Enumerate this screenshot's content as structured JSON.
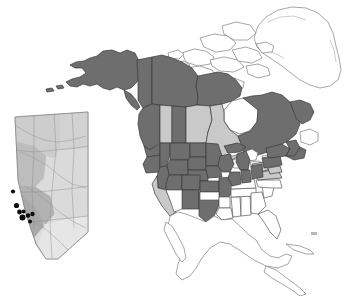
{
  "figure": {
    "title": "",
    "caption": "",
    "background_color": "#ffffff",
    "width": 357,
    "height": 296
  },
  "legend_colors": {
    "shaded_dark": "#6e6e6e",
    "shaded_light": "#c9c9c9",
    "unshaded": "#ffffff",
    "outline": "#5a5a5a",
    "site_dot": "#0d0d0d"
  },
  "main_map": {
    "name": "north-america-distribution-map",
    "region": "North America",
    "shading_classes": [
      "dark",
      "light",
      "white"
    ],
    "regions": [
      {
        "id": "alaska",
        "label": "Alaska",
        "shade": "dark"
      },
      {
        "id": "yukon",
        "label": "Yukon",
        "shade": "dark"
      },
      {
        "id": "northwest-terr",
        "label": "Northwest Territories",
        "shade": "dark"
      },
      {
        "id": "nunavut-mainland",
        "label": "Nunavut",
        "shade": "dark"
      },
      {
        "id": "arctic-islands",
        "label": "Arctic Archipelago",
        "shade": "white"
      },
      {
        "id": "greenland",
        "label": "Greenland",
        "shade": "white"
      },
      {
        "id": "british-columbia",
        "label": "British Columbia",
        "shade": "dark"
      },
      {
        "id": "alberta",
        "label": "Alberta",
        "shade": "light"
      },
      {
        "id": "saskatchewan",
        "label": "Saskatchewan",
        "shade": "dark"
      },
      {
        "id": "manitoba",
        "label": "Manitoba",
        "shade": "light"
      },
      {
        "id": "ontario",
        "label": "Ontario",
        "shade": "light"
      },
      {
        "id": "quebec",
        "label": "Quebec",
        "shade": "dark"
      },
      {
        "id": "labrador",
        "label": "Labrador",
        "shade": "dark"
      },
      {
        "id": "newfoundland",
        "label": "Newfoundland",
        "shade": "white"
      },
      {
        "id": "maritimes",
        "label": "Maritime Provinces",
        "shade": "dark"
      },
      {
        "id": "washington",
        "label": "Washington",
        "shade": "dark"
      },
      {
        "id": "oregon",
        "label": "Oregon",
        "shade": "dark"
      },
      {
        "id": "idaho",
        "label": "Idaho",
        "shade": "dark"
      },
      {
        "id": "montana",
        "label": "Montana",
        "shade": "dark"
      },
      {
        "id": "wyoming",
        "label": "Wyoming",
        "shade": "dark"
      },
      {
        "id": "north-dakota",
        "label": "North Dakota",
        "shade": "dark"
      },
      {
        "id": "south-dakota",
        "label": "South Dakota",
        "shade": "dark"
      },
      {
        "id": "nebraska",
        "label": "Nebraska",
        "shade": "dark"
      },
      {
        "id": "minnesota",
        "label": "Minnesota",
        "shade": "dark"
      },
      {
        "id": "iowa",
        "label": "Iowa",
        "shade": "dark"
      },
      {
        "id": "wisconsin",
        "label": "Wisconsin",
        "shade": "dark"
      },
      {
        "id": "michigan",
        "label": "Michigan",
        "shade": "dark"
      },
      {
        "id": "illinois",
        "label": "Illinois",
        "shade": "dark"
      },
      {
        "id": "indiana",
        "label": "Indiana",
        "shade": "dark"
      },
      {
        "id": "ohio",
        "label": "Ohio",
        "shade": "dark"
      },
      {
        "id": "pennsylvania",
        "label": "Pennsylvania",
        "shade": "dark"
      },
      {
        "id": "new-york",
        "label": "New York",
        "shade": "dark"
      },
      {
        "id": "new-england",
        "label": "New England",
        "shade": "dark"
      },
      {
        "id": "nevada",
        "label": "Nevada",
        "shade": "dark"
      },
      {
        "id": "utah",
        "label": "Utah",
        "shade": "dark"
      },
      {
        "id": "colorado",
        "label": "Colorado",
        "shade": "dark"
      },
      {
        "id": "kansas",
        "label": "Kansas",
        "shade": "dark"
      },
      {
        "id": "missouri",
        "label": "Missouri",
        "shade": "dark"
      },
      {
        "id": "new-mexico",
        "label": "New Mexico",
        "shade": "dark"
      },
      {
        "id": "texas",
        "label": "Texas",
        "shade": "dark"
      },
      {
        "id": "california",
        "label": "California",
        "shade": "light"
      },
      {
        "id": "arizona",
        "label": "Arizona",
        "shade": "white"
      },
      {
        "id": "oklahoma",
        "label": "Oklahoma",
        "shade": "white"
      },
      {
        "id": "arkansas",
        "label": "Arkansas",
        "shade": "white"
      },
      {
        "id": "kentucky",
        "label": "Kentucky",
        "shade": "white"
      },
      {
        "id": "west-virginia",
        "label": "West Virginia",
        "shade": "light"
      },
      {
        "id": "virginia",
        "label": "Virginia",
        "shade": "light"
      },
      {
        "id": "maryland",
        "label": "Maryland",
        "shade": "light"
      },
      {
        "id": "tennessee",
        "label": "Tennessee",
        "shade": "white"
      },
      {
        "id": "north-carolina",
        "label": "North Carolina",
        "shade": "white"
      },
      {
        "id": "south-carolina",
        "label": "South Carolina",
        "shade": "white"
      },
      {
        "id": "georgia",
        "label": "Georgia",
        "shade": "white"
      },
      {
        "id": "florida",
        "label": "Florida",
        "shade": "white"
      },
      {
        "id": "alabama",
        "label": "Alabama",
        "shade": "white"
      },
      {
        "id": "mississippi",
        "label": "Mississippi",
        "shade": "white"
      },
      {
        "id": "louisiana",
        "label": "Louisiana",
        "shade": "white"
      },
      {
        "id": "mexico",
        "label": "Mexico",
        "shade": "white"
      },
      {
        "id": "central-america",
        "label": "Central America",
        "shade": "white"
      },
      {
        "id": "cuba",
        "label": "Cuba",
        "shade": "white"
      },
      {
        "id": "great-lakes",
        "label": "Great Lakes",
        "shade": "white"
      },
      {
        "id": "hudson-bay",
        "label": "Hudson Bay",
        "shade": "white"
      }
    ]
  },
  "inset_map": {
    "name": "alberta-inset-map",
    "label": "Alberta",
    "description": "Shaded relief / natural region inset of Alberta with sampling site locations",
    "site_count": 8,
    "sites": [
      {
        "id": "site-1",
        "x": 13.0,
        "y": 191.5,
        "r": 2.1
      },
      {
        "id": "site-2",
        "x": 16.5,
        "y": 205.5,
        "r": 2.6
      },
      {
        "id": "site-3",
        "x": 19.5,
        "y": 212.0,
        "r": 2.4
      },
      {
        "id": "site-4",
        "x": 23.5,
        "y": 211.5,
        "r": 2.0
      },
      {
        "id": "site-5",
        "x": 22.5,
        "y": 217.5,
        "r": 3.0
      },
      {
        "id": "site-6",
        "x": 28.0,
        "y": 215.5,
        "r": 2.3
      },
      {
        "id": "site-7",
        "x": 32.5,
        "y": 214.0,
        "r": 2.2
      },
      {
        "id": "site-8",
        "x": 30.0,
        "y": 221.5,
        "r": 2.0
      }
    ]
  }
}
